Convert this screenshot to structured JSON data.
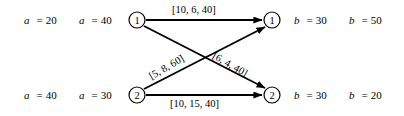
{
  "diagram": {
    "type": "bipartite-network-flow",
    "nodes": [
      {
        "id": "source-1",
        "label": "1",
        "x": 137,
        "y": 20,
        "r": 8
      },
      {
        "id": "source-2",
        "label": "2",
        "x": 137,
        "y": 95,
        "r": 8
      },
      {
        "id": "sink-1",
        "label": "1",
        "x": 272,
        "y": 20,
        "r": 8
      },
      {
        "id": "sink-2",
        "label": "2",
        "x": 272,
        "y": 95,
        "r": 8
      }
    ],
    "edges": [
      {
        "id": "edge-s1-t1",
        "from": "source-1",
        "to": "sink-1",
        "label": "[10, 6, 40]"
      },
      {
        "id": "edge-s2-t2",
        "from": "source-2",
        "to": "sink-2",
        "label": "[10, 15, 40]"
      },
      {
        "id": "edge-s2-t1",
        "from": "source-2",
        "to": "sink-1",
        "label": "[5, 8, 60]"
      },
      {
        "id": "edge-s1-t2",
        "from": "source-1",
        "to": "sink-2",
        "label": "[6, 4, 40]"
      }
    ],
    "supplies": [
      {
        "id": "a-1-1",
        "var": "a",
        "sup": "1",
        "sub": "1",
        "eq": "=",
        "value": "20"
      },
      {
        "id": "a-1-2",
        "var": "a",
        "sup": "2",
        "sub": "1",
        "eq": "=",
        "value": "40"
      },
      {
        "id": "a-2-1",
        "var": "a",
        "sup": "1",
        "sub": "2",
        "eq": "=",
        "value": "40"
      },
      {
        "id": "a-2-2",
        "var": "a",
        "sup": "2",
        "sub": "2",
        "eq": "=",
        "value": "30"
      }
    ],
    "demands": [
      {
        "id": "b-1-1",
        "var": "b",
        "sup": "1",
        "sub": "1",
        "eq": "=",
        "value": "30"
      },
      {
        "id": "b-1-2",
        "var": "b",
        "sup": "2",
        "sub": "1",
        "eq": "=",
        "value": "50"
      },
      {
        "id": "b-2-1",
        "var": "b",
        "sup": "1",
        "sub": "2",
        "eq": "=",
        "value": "30"
      },
      {
        "id": "b-2-2",
        "var": "b",
        "sup": "2",
        "sub": "2",
        "eq": "=",
        "value": "20"
      }
    ],
    "colors": {
      "stroke": "#000000",
      "background": "#ffffff",
      "text": "#000000"
    }
  }
}
